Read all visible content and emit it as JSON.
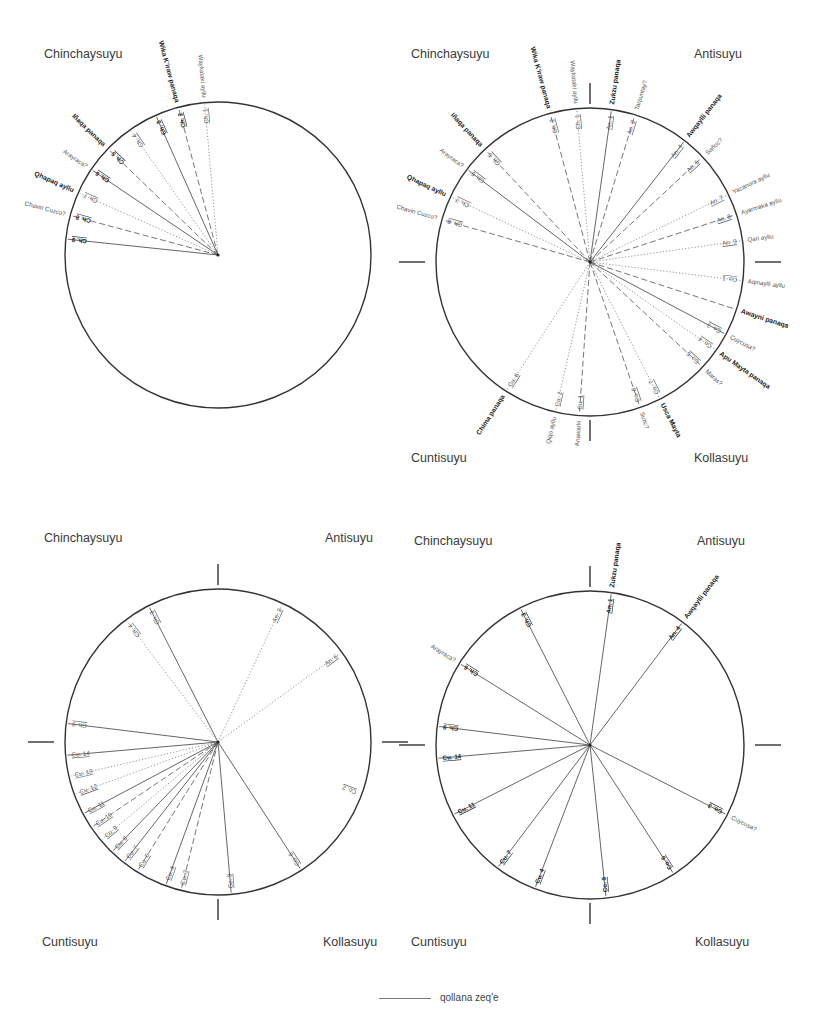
{
  "legend": {
    "label": "qollana zeq'e",
    "line_style": "solid"
  },
  "styles": {
    "solid": {
      "stroke": "#555",
      "dash": ""
    },
    "dashed": {
      "stroke": "#666",
      "dash": "6,3"
    },
    "dotted": {
      "stroke": "#888",
      "dash": "1.2,2"
    }
  },
  "diagrams": [
    {
      "id": "top-left",
      "center": [
        218,
        255
      ],
      "radius": 153,
      "show_ticks": false,
      "suyus": [
        {
          "name": "Chinchaysuyu",
          "x": 44,
          "y": 58
        }
      ],
      "spokes": [
        {
          "label": "Ch. 1",
          "angle": -5,
          "style": "dotted",
          "bold": false,
          "outer": "Waykatakí ayllu",
          "outer_bold": false
        },
        {
          "label": "Ch. 2",
          "angle": -15,
          "style": "dashed",
          "bold": true,
          "outer": "Wika K'iraw panaqa",
          "outer_bold": true
        },
        {
          "label": "Ch. 3",
          "angle": -24,
          "style": "solid",
          "bold": true,
          "outer": "",
          "outer_bold": false
        },
        {
          "label": "Ch. 4",
          "angle": -35,
          "style": "dotted",
          "bold": false,
          "outer": "",
          "outer_bold": false
        },
        {
          "label": "Ch. 5",
          "angle": -46,
          "style": "dashed",
          "bold": true,
          "outer": "Iñaqa panaqa",
          "outer_bold": true
        },
        {
          "label": "Ch. 6",
          "angle": -56,
          "style": "solid",
          "bold": true,
          "outer": "Arayraca?",
          "outer_bold": false
        },
        {
          "label": "Ch. 7",
          "angle": -66,
          "style": "dotted",
          "bold": false,
          "outer": "Qhapaq ayllu",
          "outer_bold": true
        },
        {
          "label": "Ch. 8",
          "angle": -75,
          "style": "dashed",
          "bold": true,
          "outer": "Chavin Cuzco?",
          "outer_bold": false
        },
        {
          "label": "Ch. 9",
          "angle": -84,
          "style": "solid",
          "bold": true,
          "outer": "",
          "outer_bold": false
        }
      ]
    },
    {
      "id": "top-right",
      "center": [
        590,
        262
      ],
      "radius": 154,
      "show_ticks": true,
      "suyus": [
        {
          "name": "Chinchaysuyu",
          "x": 411,
          "y": 58
        },
        {
          "name": "Antisuyu",
          "x": 694,
          "y": 58
        },
        {
          "name": "Cuntisuyu",
          "x": 411,
          "y": 462
        },
        {
          "name": "Kollasuyu",
          "x": 694,
          "y": 462
        }
      ],
      "spokes": [
        {
          "label": "Ch. 1",
          "angle": -5,
          "style": "dotted",
          "bold": false,
          "outer": "Waykatakí ayllu",
          "outer_bold": false
        },
        {
          "label": "Ch. 2",
          "angle": -15,
          "style": "dashed",
          "bold": false,
          "outer": "Wika K'iraw panaqa",
          "outer_bold": true
        },
        {
          "label": "Ch. 5",
          "angle": -43,
          "style": "dashed",
          "bold": false,
          "outer": "Iñaqa panaqa",
          "outer_bold": true
        },
        {
          "label": "Ch. 6",
          "angle": -53,
          "style": "solid",
          "bold": false,
          "outer": "Arayraca?",
          "outer_bold": false
        },
        {
          "label": "Ch. 7",
          "angle": -65,
          "style": "dotted",
          "bold": false,
          "outer": "Qhapaq ayllu",
          "outer_bold": true
        },
        {
          "label": "Ch. 8",
          "angle": -74,
          "style": "dashed",
          "bold": false,
          "outer": "Chavin Cuzco?",
          "outer_bold": false
        },
        {
          "label": "An. 1",
          "angle": 8,
          "style": "solid",
          "bold": false,
          "outer": "Zukzu panaqa",
          "outer_bold": true
        },
        {
          "label": "An. 2",
          "angle": 17,
          "style": "dashed",
          "bold": false,
          "outer": "Tarpuntay?",
          "outer_bold": false
        },
        {
          "label": "An. 4",
          "angle": 38,
          "style": "solid",
          "bold": false,
          "outer": "Awqaylli panaqa",
          "outer_bold": true
        },
        {
          "label": "An. 5",
          "angle": 47,
          "style": "dashed",
          "bold": false,
          "outer": "Sañoc?",
          "outer_bold": false
        },
        {
          "label": "An. 7",
          "angle": 64,
          "style": "dotted",
          "bold": false,
          "outer": "Yacanora ayllu",
          "outer_bold": false
        },
        {
          "label": "An. 8",
          "angle": 72,
          "style": "dashed",
          "bold": false,
          "outer": "Ayarmaka ayllu",
          "outer_bold": false
        },
        {
          "label": "An. 9",
          "angle": 82,
          "style": "dotted",
          "bold": false,
          "outer": "Qari ayllu",
          "outer_bold": false
        },
        {
          "label": "Co. 1",
          "angle": 97,
          "style": "dotted",
          "bold": false,
          "outer": "Aqinaylli ayllu",
          "outer_bold": false
        },
        {
          "label": "",
          "angle": 108,
          "style": "dashed",
          "bold": false,
          "outer": "Awayni panaqa",
          "outer_bold": true
        },
        {
          "label": "Co. 3",
          "angle": 118,
          "style": "solid",
          "bold": false,
          "outer": "Cuycusa?",
          "outer_bold": false
        },
        {
          "label": "Co. 4",
          "angle": 125,
          "style": "dotted",
          "bold": false,
          "outer": "Apu Mayta panaqa",
          "outer_bold": true
        },
        {
          "label": "Co. 5",
          "angle": 133,
          "style": "dashed",
          "bold": false,
          "outer": "Maras?",
          "outer_bold": false
        },
        {
          "label": "Co. 7",
          "angle": 153,
          "style": "dotted",
          "bold": false,
          "outer": "Usca Mayta",
          "outer_bold": true
        },
        {
          "label": "Co. 8",
          "angle": 161,
          "style": "dashed",
          "bold": false,
          "outer": "Sutic?",
          "outer_bold": false
        },
        {
          "label": "Cu. 1",
          "angle": 184,
          "style": "dashed",
          "bold": false,
          "outer": "Anawarki",
          "outer_bold": false
        },
        {
          "label": "Cu. 2",
          "angle": 193,
          "style": "dotted",
          "bold": false,
          "outer": "Qiqo ayllu",
          "outer_bold": false
        },
        {
          "label": "Cu. 6",
          "angle": 213,
          "style": "dotted",
          "bold": false,
          "outer": "Chima panaqa",
          "outer_bold": true
        }
      ]
    },
    {
      "id": "bottom-left",
      "center": [
        218,
        742
      ],
      "radius": 153,
      "show_ticks": true,
      "suyus": [
        {
          "name": "Chinchaysuyu",
          "x": 44,
          "y": 542
        },
        {
          "name": "Antisuyu",
          "x": 325,
          "y": 542
        },
        {
          "name": "Cuntisuyu",
          "x": 42,
          "y": 946
        },
        {
          "name": "Kollasuyu",
          "x": 323,
          "y": 946
        }
      ],
      "spokes": [
        {
          "label": "Ch. 3",
          "angle": -27,
          "style": "solid",
          "bold": false,
          "outer": ""
        },
        {
          "label": "Ch. 4",
          "angle": -37,
          "style": "dotted",
          "bold": false,
          "outer": ""
        },
        {
          "label": "An. 3",
          "angle": 25,
          "style": "dotted",
          "bold": false,
          "outer": ""
        },
        {
          "label": "An. 6",
          "angle": 54,
          "style": "dotted",
          "bold": false,
          "outer": ""
        },
        {
          "label": "Ch. 9",
          "angle": -83,
          "style": "solid",
          "bold": false,
          "outer": ""
        },
        {
          "label": "Cu. 14",
          "angle": -95,
          "style": "solid",
          "bold": false,
          "outer": ""
        },
        {
          "label": "Cu. 13",
          "angle": -103,
          "style": "dotted",
          "bold": false,
          "outer": ""
        },
        {
          "label": "Cu. 12",
          "angle": -110,
          "style": "dotted",
          "bold": false,
          "outer": ""
        },
        {
          "label": "Cu. 11",
          "angle": -118,
          "style": "solid",
          "bold": false,
          "outer": ""
        },
        {
          "label": "Cu. 10",
          "angle": -124,
          "style": "dashed",
          "bold": false,
          "outer": ""
        },
        {
          "label": "Cu. 9",
          "angle": -130,
          "style": "dotted",
          "bold": false,
          "outer": ""
        },
        {
          "label": "Cu. 8",
          "angle": -136,
          "style": "solid",
          "bold": false,
          "outer": ""
        },
        {
          "label": "Cu. 7",
          "angle": -142,
          "style": "solid",
          "bold": false,
          "outer": ""
        },
        {
          "label": "Cu. 6",
          "angle": -148,
          "style": "dashed",
          "bold": false,
          "outer": ""
        },
        {
          "label": "Cu. 4",
          "angle": -160,
          "style": "solid",
          "bold": false,
          "outer": ""
        },
        {
          "label": "Cu. 3",
          "angle": -166,
          "style": "dashed",
          "bold": false,
          "outer": ""
        },
        {
          "label": "Co. 9",
          "angle": 175,
          "style": "solid",
          "bold": false,
          "outer": ""
        },
        {
          "label": "Co. 6",
          "angle": 147,
          "style": "solid",
          "bold": false,
          "outer": ""
        },
        {
          "label": "Co. 2",
          "angle": 110,
          "style": "none",
          "bold": false,
          "outer": ""
        }
      ]
    },
    {
      "id": "bottom-right",
      "center": [
        590,
        745
      ],
      "radius": 154,
      "show_ticks": true,
      "suyus": [
        {
          "name": "Chinchaysuyu",
          "x": 414,
          "y": 545
        },
        {
          "name": "Antisuyu",
          "x": 697,
          "y": 545
        },
        {
          "name": "Cuntisuyu",
          "x": 411,
          "y": 946
        },
        {
          "name": "Kollasuyu",
          "x": 695,
          "y": 946
        }
      ],
      "spokes": [
        {
          "label": "Ch. 3",
          "angle": -27,
          "style": "solid",
          "bold": true,
          "outer": ""
        },
        {
          "label": "Ch. 6",
          "angle": -58,
          "style": "solid",
          "bold": true,
          "outer": "Arayraca?",
          "outer_bold": false
        },
        {
          "label": "Ch. 9",
          "angle": -83,
          "style": "solid",
          "bold": true,
          "outer": ""
        },
        {
          "label": "Cu. 14",
          "angle": -95,
          "style": "solid",
          "bold": true,
          "outer": ""
        },
        {
          "label": "Cu. 11",
          "angle": -117,
          "style": "solid",
          "bold": true,
          "outer": ""
        },
        {
          "label": "Cu. 7",
          "angle": -143,
          "style": "solid",
          "bold": true,
          "outer": ""
        },
        {
          "label": "Cu. 4",
          "angle": -159,
          "style": "solid",
          "bold": true,
          "outer": ""
        },
        {
          "label": "Co. 9",
          "angle": 174,
          "style": "solid",
          "bold": true,
          "outer": ""
        },
        {
          "label": "Co. 6",
          "angle": 147,
          "style": "solid",
          "bold": true,
          "outer": ""
        },
        {
          "label": "Co. 3",
          "angle": 117,
          "style": "solid",
          "bold": true,
          "outer": "Cuycusa?",
          "outer_bold": false
        },
        {
          "label": "An. 1",
          "angle": 8,
          "style": "solid",
          "bold": true,
          "outer": "Zukzu panaqa",
          "outer_bold": true
        },
        {
          "label": "An. 4",
          "angle": 37,
          "style": "solid",
          "bold": true,
          "outer": "Awqaylli panaqa",
          "outer_bold": true
        }
      ]
    }
  ]
}
